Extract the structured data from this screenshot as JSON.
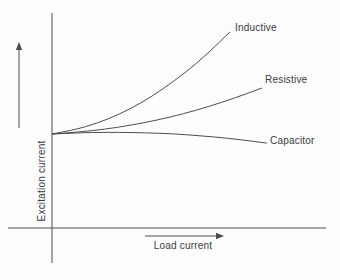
{
  "figure": {
    "background_color": "#fdfdfd",
    "line_color": "#4d4d4d",
    "text_color": "#3a3a3a"
  },
  "chart_data": {
    "type": "line",
    "title": "",
    "xlabel": "Load current",
    "ylabel": "Excitation current",
    "xlim": [
      0,
      1
    ],
    "ylim": [
      0,
      1
    ],
    "grid": false,
    "ticks": "none",
    "legend": "inline-end-labels",
    "axis_arrows": {
      "x": true,
      "y": true
    },
    "note": "Qualitative curves; point coordinates are fractions of the axis ranges estimated from the figure.",
    "series": [
      {
        "name": "Inductive",
        "points": [
          [
            0.0,
            0.437
          ],
          [
            0.081,
            0.456
          ],
          [
            0.163,
            0.486
          ],
          [
            0.245,
            0.528
          ],
          [
            0.326,
            0.581
          ],
          [
            0.407,
            0.647
          ],
          [
            0.489,
            0.723
          ],
          [
            0.571,
            0.812
          ],
          [
            0.652,
            0.912
          ]
        ]
      },
      {
        "name": "Resistive",
        "points": [
          [
            0.0,
            0.437
          ],
          [
            0.096,
            0.446
          ],
          [
            0.192,
            0.459
          ],
          [
            0.288,
            0.478
          ],
          [
            0.385,
            0.502
          ],
          [
            0.481,
            0.531
          ],
          [
            0.577,
            0.566
          ],
          [
            0.673,
            0.606
          ],
          [
            0.769,
            0.651
          ]
        ]
      },
      {
        "name": "Capacitor",
        "points": [
          [
            0.0,
            0.437
          ],
          [
            0.099,
            0.443
          ],
          [
            0.198,
            0.445
          ],
          [
            0.296,
            0.444
          ],
          [
            0.395,
            0.441
          ],
          [
            0.493,
            0.434
          ],
          [
            0.591,
            0.424
          ],
          [
            0.689,
            0.411
          ],
          [
            0.787,
            0.395
          ]
        ]
      }
    ]
  }
}
